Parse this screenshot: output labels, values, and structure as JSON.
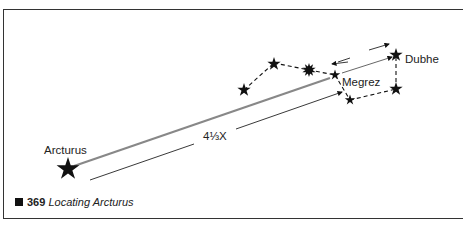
{
  "figure": {
    "number": "369",
    "caption": "Locating Arcturus"
  },
  "labels": {
    "arcturus": "Arcturus",
    "megrez": "Megrez",
    "dubhe": "Dubhe",
    "distance": "4⅓X"
  },
  "colors": {
    "ink": "#111111",
    "pointer_line": "#888888",
    "frame": "#333333"
  }
}
